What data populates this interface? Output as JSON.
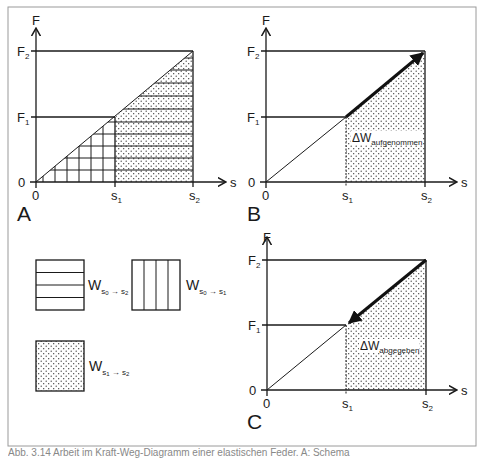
{
  "figure": {
    "panels": [
      {
        "id": "A",
        "label": "A",
        "y_axis": "F",
        "x_axis": "s",
        "y_ticks": [
          "0",
          "F1",
          "F2"
        ],
        "x_ticks": [
          "0",
          "s1",
          "s2"
        ],
        "regions": [
          {
            "range": "0 -> s1",
            "fill": "grid (horizontal + vertical hatching)"
          },
          {
            "range": "s1 -> s2",
            "fill": "dots + horizontal hatching"
          }
        ]
      },
      {
        "id": "B",
        "label": "B",
        "y_axis": "F",
        "x_axis": "s",
        "y_ticks": [
          "0",
          "F1",
          "F2"
        ],
        "x_ticks": [
          "0",
          "s1",
          "s2"
        ],
        "arrow": "s1 -> s2 (upward)",
        "area_label": "ΔW",
        "area_label_sub": "aufgenommen"
      },
      {
        "id": "C",
        "label": "C",
        "y_axis": "F",
        "x_axis": "s",
        "y_ticks": [
          "0",
          "F1",
          "F2"
        ],
        "x_ticks": [
          "0",
          "s1",
          "s2"
        ],
        "arrow": "s2 -> s1 (downward)",
        "area_label": "ΔW",
        "area_label_sub": "abgegeben"
      }
    ],
    "labels": {
      "F": "F",
      "s": "s",
      "zero": "0",
      "F_main": "F",
      "s_main": "s",
      "one": "1",
      "two": "2",
      "panel_A": "A",
      "panel_B": "B",
      "panel_C": "C",
      "delta_W": "ΔW",
      "aufgenommen": "aufgenommen",
      "abgegeben": "abgegeben"
    },
    "legend": [
      {
        "pattern": "horizontal-lines",
        "symbol": "W",
        "subscript": "s0 → s2",
        "sub_a": "s",
        "sub_a_idx": "0",
        "arrow": " → ",
        "sub_b": "s",
        "sub_b_idx": "2"
      },
      {
        "pattern": "vertical-lines",
        "symbol": "W",
        "subscript": "s0 → s1",
        "sub_a": "s",
        "sub_a_idx": "0",
        "arrow": " → ",
        "sub_b": "s",
        "sub_b_idx": "1"
      },
      {
        "pattern": "dots",
        "symbol": "W",
        "subscript": "s1 → s2",
        "sub_a": "s",
        "sub_a_idx": "1",
        "arrow": " → ",
        "sub_b": "s",
        "sub_b_idx": "2"
      }
    ],
    "caption": "Abb. 3.14 Arbeit im Kraft-Weg-Diagramm einer elastischen Feder. A: Schema"
  },
  "colors": {
    "line": "#1a1a1a",
    "frame": "#9a9a9a",
    "background": "#ffffff"
  }
}
